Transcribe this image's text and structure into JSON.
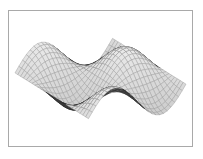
{
  "figure": {
    "title": "",
    "frame_border_color": "#a9a9a9",
    "background_color": "#ffffff"
  },
  "chart_data": {
    "type": "line",
    "subtype": "3d-mesh-surface",
    "title": "",
    "subtitle": "",
    "xlabel": "",
    "ylabel": "",
    "zlabel": "",
    "grid": true,
    "legend": false,
    "legend_position": "none",
    "axes_visible": false,
    "tick_labels": [],
    "annotations": [],
    "colors": {
      "mesh_front": "#2b2b2b",
      "mesh_back": "#9a9a9a",
      "fill_front": "#5a5a5a",
      "fill_back": "#d8d8d8",
      "background": "#ffffff",
      "frame": "#a9a9a9"
    },
    "surface": {
      "function": "z = sin(x) * cos(y) wave-saddle",
      "x_range": [
        -3.1416,
        3.1416
      ],
      "y_range": [
        -3.1416,
        3.1416
      ],
      "z_range": [
        -1,
        1
      ],
      "mesh_divisions_u": 26,
      "mesh_divisions_v": 26,
      "view_azimuth_deg": -37,
      "view_elevation_deg": 28,
      "x": [
        -3.1416,
        -2.5133,
        -1.885,
        -1.2566,
        -0.6283,
        0,
        0.6283,
        1.2566,
        1.885,
        2.5133,
        3.1416
      ],
      "y": [
        -3.1416,
        -2.5133,
        -1.885,
        -1.2566,
        -0.6283,
        0,
        0.6283,
        1.2566,
        1.885,
        2.5133,
        3.1416
      ],
      "z_rows": [
        [
          0,
          0,
          0,
          0,
          0,
          0,
          0,
          0,
          0,
          0,
          0
        ],
        [
          0.48,
          0.38,
          0.18,
          -0.18,
          -0.48,
          -0.59,
          -0.48,
          -0.18,
          0.18,
          0.38,
          0.48
        ],
        [
          0.78,
          0.62,
          0.29,
          -0.29,
          -0.78,
          -0.95,
          -0.78,
          -0.29,
          0.29,
          0.62,
          0.78
        ],
        [
          0.78,
          0.62,
          0.29,
          -0.29,
          -0.78,
          -0.95,
          -0.78,
          -0.29,
          0.29,
          0.62,
          0.78
        ],
        [
          0.48,
          0.38,
          0.18,
          -0.18,
          -0.48,
          -0.59,
          -0.48,
          -0.18,
          0.18,
          0.38,
          0.48
        ],
        [
          0,
          0,
          0,
          0,
          0,
          0,
          0,
          0,
          0,
          0,
          0
        ],
        [
          -0.48,
          -0.38,
          -0.18,
          0.18,
          0.48,
          0.59,
          0.48,
          0.18,
          -0.18,
          -0.38,
          -0.48
        ],
        [
          -0.78,
          -0.62,
          -0.29,
          0.29,
          0.78,
          0.95,
          0.78,
          0.29,
          -0.29,
          -0.62,
          -0.78
        ],
        [
          -0.78,
          -0.62,
          -0.29,
          0.29,
          0.78,
          0.95,
          0.78,
          0.29,
          -0.29,
          -0.62,
          -0.78
        ],
        [
          -0.48,
          -0.38,
          -0.18,
          0.18,
          0.48,
          0.59,
          0.48,
          0.18,
          -0.18,
          -0.38,
          -0.48
        ],
        [
          0,
          0,
          0,
          0,
          0,
          0,
          0,
          0,
          0,
          0,
          0
        ]
      ]
    }
  }
}
